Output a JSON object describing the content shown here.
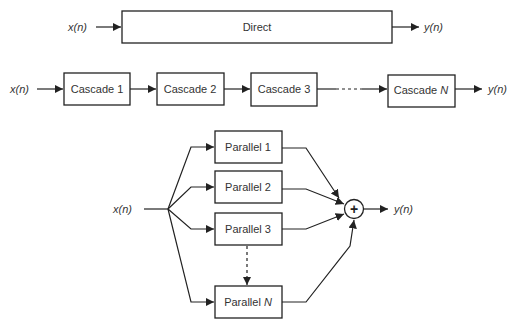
{
  "direct": {
    "input_label": "x(n)",
    "block_label": "Direct",
    "output_label": "y(n)"
  },
  "cascade": {
    "input_label": "x(n)",
    "blocks": [
      {
        "label": "Cascade 1"
      },
      {
        "label": "Cascade 2"
      },
      {
        "label": "Cascade 3"
      },
      {
        "label": "Cascade",
        "suffix": "N"
      }
    ],
    "output_label": "y(n)"
  },
  "parallel": {
    "input_label": "x(n)",
    "blocks": [
      {
        "label": "Parallel 1"
      },
      {
        "label": "Parallel 2"
      },
      {
        "label": "Parallel 3"
      },
      {
        "label": "Parallel",
        "suffix": "N"
      }
    ],
    "summer_symbol": "+",
    "output_label": "y(n)"
  },
  "colors": {
    "line": "#222222",
    "text": "#333333",
    "background": "#ffffff"
  }
}
